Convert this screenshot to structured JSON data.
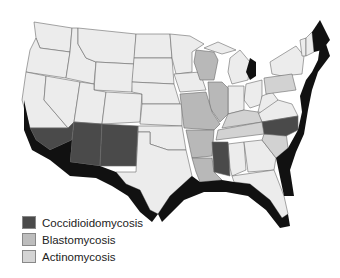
{
  "map": {
    "title": "",
    "region": "Contiguous United States",
    "colors": {
      "base": "#ececec",
      "coccidioidomycosis": "#4a4a4a",
      "blastomycosis": "#b8b8b8",
      "actinomycosis": "#d2d2d2",
      "coastal": "#111111",
      "border": "#6a6a6a"
    }
  },
  "legend": {
    "items": [
      {
        "label": "Coccidioidomycosis",
        "color": "#4a4a4a"
      },
      {
        "label": "Blastomycosis",
        "color": "#bdbdbd"
      },
      {
        "label": "Actinomycosis",
        "color": "#d4d4d4"
      }
    ]
  }
}
